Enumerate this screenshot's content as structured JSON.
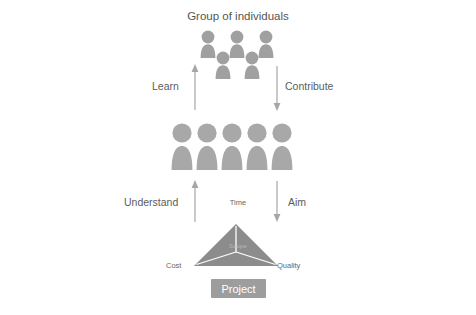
{
  "diagram": {
    "title": "Group of individuals",
    "flows": {
      "learn": "Learn",
      "contribute": "Contribute",
      "understand": "Understand",
      "aim": "Aim"
    },
    "triangle": {
      "apex": "Time",
      "left": "Cost",
      "right": "Quality",
      "center": "Scope"
    },
    "project_box": "Project"
  },
  "colors": {
    "background": "#ffffff",
    "band": "#ebebeb",
    "figure": "#a8a8a8",
    "figure_group": "#a0a0a0",
    "triangle": "#8c8c8c",
    "project_box": "#9d9d9d",
    "project_text": "#ffffff",
    "arrow": "#a6a6a6",
    "text": "#5c5c5c",
    "small_text": "#666666",
    "scope_text": "#b9b9b9"
  },
  "counts": {
    "group_top_row_figures": 3,
    "group_bottom_row_figures": 2,
    "band_figures": 5
  }
}
